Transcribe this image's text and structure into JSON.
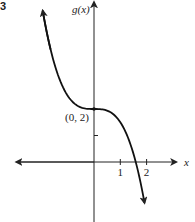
{
  "figure_number": "3",
  "chart_data": {
    "type": "line",
    "title": "",
    "xlabel": "x",
    "ylabel": "g(x)",
    "xlim": [
      -3.1,
      3.2
    ],
    "ylim": [
      -3.3,
      6.1
    ],
    "x_ticks": [
      1,
      2
    ],
    "x_tick_labels": [
      "1",
      "2"
    ],
    "y_ticks": [
      1,
      2
    ],
    "grid": false,
    "series": [
      {
        "name": "g(x)",
        "description": "decreasing cubic through (0, 2), crossing x-axis near x = 1.6",
        "x": [
          -1.95,
          -1.5,
          -1.0,
          -0.5,
          0,
          0.5,
          1.0,
          1.3,
          1.6,
          1.92
        ],
        "y": [
          5.7,
          3.7,
          2.5,
          2.06,
          2,
          1.94,
          1.5,
          0.9,
          -0.05,
          -1.55
        ]
      }
    ],
    "annotations": [
      {
        "text": "(0, 2)",
        "x": 0,
        "y": 2
      }
    ]
  }
}
